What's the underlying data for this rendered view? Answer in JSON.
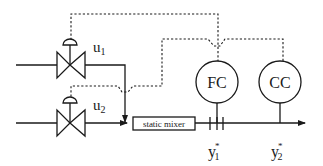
{
  "diagram": {
    "type": "process-control-schematic",
    "valves": [
      {
        "id": "valve-1",
        "label": "u",
        "subscript": "1"
      },
      {
        "id": "valve-2",
        "label": "u",
        "subscript": "2"
      }
    ],
    "controllers": [
      {
        "id": "fc",
        "label": "FC"
      },
      {
        "id": "cc",
        "label": "CC"
      }
    ],
    "mixer": {
      "label": "static mixer"
    },
    "measurements": [
      {
        "id": "y1",
        "label": "y",
        "subscript": "1",
        "superscript": "*"
      },
      {
        "id": "y2",
        "label": "y",
        "subscript": "2",
        "superscript": "*"
      }
    ],
    "colors": {
      "line": "#1a1a1a",
      "background": "#ffffff"
    }
  }
}
